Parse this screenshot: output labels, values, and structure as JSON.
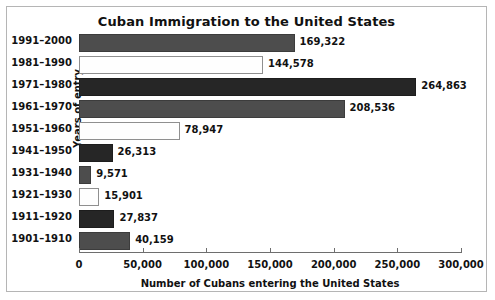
{
  "chart_data": {
    "type": "bar",
    "orientation": "horizontal",
    "title": "Cuban Immigration to the United States",
    "xlabel": "Number of Cubans entering the United States",
    "ylabel": "Years of entry",
    "categories": [
      "1991–2000",
      "1981–1990",
      "1971–1980",
      "1961–1970",
      "1951–1960",
      "1941–1950",
      "1931–1940",
      "1921–1930",
      "1911–1920",
      "1901–1910"
    ],
    "values": [
      169322,
      144578,
      264863,
      208536,
      78947,
      26313,
      9571,
      15901,
      27837,
      40159
    ],
    "value_labels": [
      "169,322",
      "144,578",
      "264,863",
      "208,536",
      "78,947",
      "26,313",
      "9,571",
      "15,901",
      "27,837",
      "40,159"
    ],
    "bar_fills": [
      "darkgray",
      "white",
      "black",
      "darkgray",
      "white",
      "black",
      "darkgray",
      "white",
      "black",
      "darkgray"
    ],
    "xlim": [
      0,
      300000
    ],
    "xticks": [
      0,
      50000,
      100000,
      150000,
      200000,
      250000,
      300000
    ],
    "xtick_labels": [
      "0",
      "50,000",
      "100,000",
      "150,000",
      "200,000",
      "250,000",
      "300,000"
    ],
    "grid": false,
    "legend": false,
    "colors": {
      "dark_gray": "#4d4d4d",
      "white": "#fefefe",
      "near_black": "#262626",
      "axis": "#6e6e6e",
      "text": "#111111",
      "frame": "#b5b5b5",
      "background": "#ffffff"
    }
  }
}
